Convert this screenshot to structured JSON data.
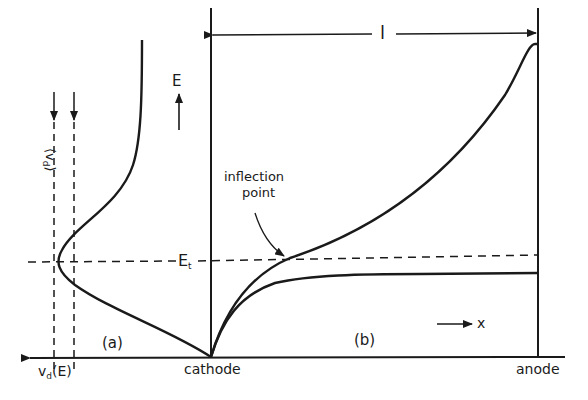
{
  "figure": {
    "panels": [
      {
        "id": "a",
        "label": "(a)",
        "description": "drift velocity vs field"
      },
      {
        "id": "b",
        "label": "(b)",
        "description": "field vs position between cathode and anode"
      }
    ],
    "labels": {
      "length": "l",
      "field_axis": "E",
      "threshold_field": "E",
      "threshold_sub": "t",
      "inflection_line1": "inflection",
      "inflection_line2": "point",
      "velocity_axis_main": "v",
      "velocity_axis_sub": "d",
      "velocity_axis_arg": "(E)",
      "avg_velocity_main": "⟨v",
      "avg_velocity_sub": "d",
      "avg_velocity_close": "⟩",
      "position_axis": "x",
      "cathode": "cathode",
      "anode": "anode",
      "panel_a": "(a)",
      "panel_b": "(b)"
    },
    "colors": {
      "ink": "#1a1a1a",
      "background": "#ffffff"
    }
  }
}
